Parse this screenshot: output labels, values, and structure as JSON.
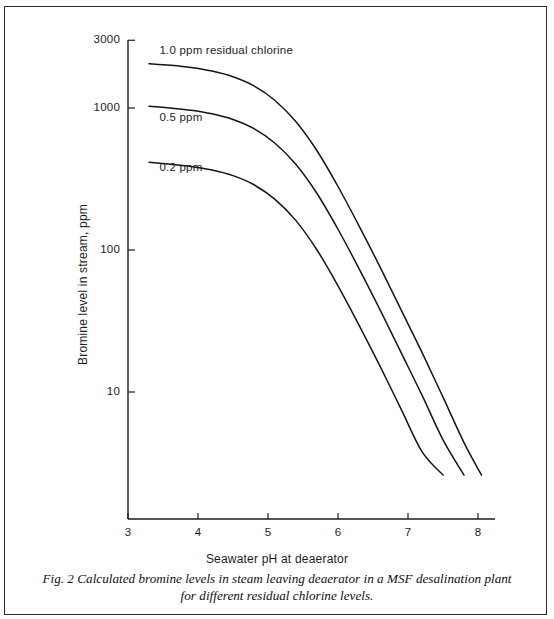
{
  "caption": {
    "line1": "Fig. 2 Calculated bromine levels in steam leaving deaerator in a MSF desalination plant",
    "line2": "for different residual chlorine levels."
  },
  "chart_data": {
    "type": "line",
    "title": "",
    "xlabel": "Seawater pH at deaerator",
    "ylabel": "Bromine level in stream, ppm",
    "yscale": "log",
    "xlim": [
      2.85,
      8.1
    ],
    "ylim": [
      2.2,
      3000
    ],
    "grid": false,
    "legend_position": "inline-labels",
    "xticks": [
      "3",
      "4",
      "5",
      "6",
      "7",
      "8"
    ],
    "xtick_values": [
      3,
      4,
      5,
      6,
      7,
      8
    ],
    "yticks": [
      "3000",
      "1000",
      "100",
      "10"
    ],
    "ytick_values": [
      3000,
      1000,
      100,
      10
    ],
    "series": [
      {
        "name": "1.0 ppm residual chlorine",
        "label": "1.0 ppm residual chlorine",
        "label_x": 3.45,
        "label_y": 2500,
        "x": [
          3.3,
          3.6,
          3.9,
          4.2,
          4.5,
          4.8,
          5.1,
          5.4,
          5.7,
          6.0,
          6.3,
          6.6,
          6.9,
          7.2,
          7.5,
          7.8,
          8.05
        ],
        "y": [
          2050,
          2000,
          1930,
          1820,
          1660,
          1430,
          1130,
          800,
          500,
          280,
          148,
          76,
          38,
          19,
          9.2,
          4.4,
          2.6
        ]
      },
      {
        "name": "0.5 ppm",
        "label": "0.5 ppm",
        "label_x": 3.45,
        "label_y": 840,
        "x": [
          3.3,
          3.6,
          3.9,
          4.2,
          4.5,
          4.8,
          5.1,
          5.4,
          5.7,
          6.0,
          6.3,
          6.6,
          6.9,
          7.2,
          7.5,
          7.8
        ],
        "y": [
          1030,
          1000,
          965,
          910,
          830,
          715,
          565,
          400,
          250,
          140,
          74,
          38,
          19,
          9.5,
          4.6,
          2.6
        ]
      },
      {
        "name": "0.2 ppm",
        "label": "0.2 ppm",
        "label_x": 3.45,
        "label_y": 370,
        "x": [
          3.3,
          3.6,
          3.9,
          4.2,
          4.5,
          4.8,
          5.1,
          5.4,
          5.7,
          6.0,
          6.3,
          6.6,
          6.9,
          7.2,
          7.5
        ],
        "y": [
          415,
          402,
          388,
          366,
          334,
          288,
          227,
          161,
          100,
          56,
          29.6,
          15.2,
          7.6,
          3.8,
          2.6
        ]
      }
    ],
    "colors": {
      "axis": "#1d1d1d",
      "curve": "#151515",
      "background": "#ffffff"
    }
  }
}
